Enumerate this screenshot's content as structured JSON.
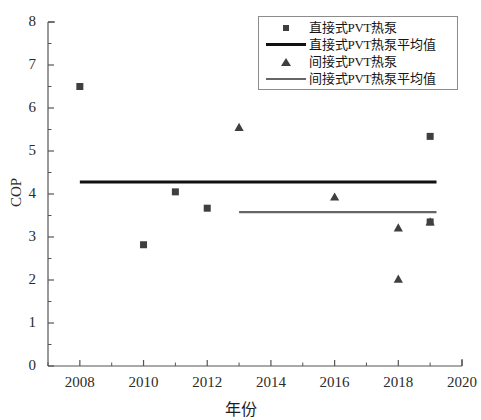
{
  "chart_data": {
    "type": "scatter",
    "title": "",
    "xlabel": "年份",
    "ylabel": "COP",
    "xlim": [
      2007,
      2020
    ],
    "ylim": [
      0,
      8
    ],
    "xticks": [
      2008,
      2010,
      2012,
      2014,
      2016,
      2018,
      2020
    ],
    "xtick_labels": [
      "2008",
      "2010",
      "2012",
      "2014",
      "2016",
      "2018",
      "2020"
    ],
    "yticks": [
      0,
      1,
      2,
      3,
      4,
      5,
      6,
      7,
      8
    ],
    "ytick_labels": [
      "0",
      "1",
      "2",
      "3",
      "4",
      "5",
      "6",
      "7",
      "8"
    ],
    "x_minor_step": 1,
    "y_minor_step": 0.5,
    "grid": false,
    "legend_position": "top-right",
    "series": [
      {
        "name": "直接式PVT热泵",
        "kind": "scatter",
        "marker": "square",
        "color": "#3f3f3f",
        "points": [
          {
            "x": 2008,
            "y": 6.5
          },
          {
            "x": 2010,
            "y": 2.82
          },
          {
            "x": 2011,
            "y": 4.05
          },
          {
            "x": 2012,
            "y": 3.67
          },
          {
            "x": 2019,
            "y": 5.34
          },
          {
            "x": 2019,
            "y": 3.35
          }
        ]
      },
      {
        "name": "直接式PVT热泵平均值",
        "kind": "line",
        "color": "#111111",
        "value": 4.28,
        "x_start": 2008,
        "x_end": 2019.2,
        "points": [
          {
            "x": 2008,
            "y": 4.28
          },
          {
            "x": 2019.2,
            "y": 4.28
          }
        ]
      },
      {
        "name": "间接式PVT热泵",
        "kind": "scatter",
        "marker": "triangle",
        "color": "#3f3f3f",
        "points": [
          {
            "x": 2013,
            "y": 5.55
          },
          {
            "x": 2016,
            "y": 3.93
          },
          {
            "x": 2018,
            "y": 3.21
          },
          {
            "x": 2018,
            "y": 2.02
          },
          {
            "x": 2019,
            "y": 3.35
          }
        ]
      },
      {
        "name": "间接式PVT热泵平均值",
        "kind": "line",
        "color": "#666666",
        "value": 3.58,
        "x_start": 2013,
        "x_end": 2019.2,
        "points": [
          {
            "x": 2013,
            "y": 3.58
          },
          {
            "x": 2019.2,
            "y": 3.58
          }
        ]
      }
    ],
    "axis_color": "#555555"
  },
  "legend": {
    "items": [
      {
        "label": "直接式PVT热泵",
        "key": "square-marker"
      },
      {
        "label": "直接式PVT热泵平均值",
        "key": "dark-line"
      },
      {
        "label": "间接式PVT热泵",
        "key": "triangle-marker"
      },
      {
        "label": "间接式PVT热泵平均值",
        "key": "gray-line"
      }
    ]
  },
  "axes": {
    "x_title": "年份",
    "y_title": "COP"
  }
}
